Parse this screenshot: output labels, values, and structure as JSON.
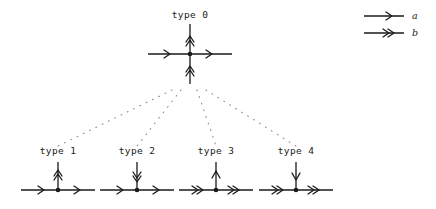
{
  "figure": {
    "background_color": "#ffffff",
    "stroke_color": "#1a1a1a",
    "dot_color": "#9a9a9a",
    "width": 436,
    "height": 209
  },
  "legend": {
    "entries": [
      {
        "id": "a",
        "label": "a",
        "arrowhead": "single",
        "icon": "single-arrow-icon"
      },
      {
        "id": "b",
        "label": "b",
        "arrowhead": "double",
        "icon": "double-arrow-icon"
      }
    ]
  },
  "nodes": [
    {
      "id": "type0",
      "label": "type 0",
      "cx": 190,
      "cy": 54,
      "horizontal": {
        "arrowhead": "single",
        "direction": "right",
        "half_length": 42
      },
      "vertical": {
        "arrowhead": "double",
        "direction": "up",
        "up_length": 30,
        "down_length": 30
      },
      "has_lower_stem": true
    },
    {
      "id": "type1",
      "label": "type 1",
      "cx": 58,
      "cy": 190,
      "horizontal": {
        "arrowhead": "single",
        "direction": "right",
        "half_length": 37
      },
      "vertical": {
        "arrowhead": "double",
        "direction": "up",
        "up_length": 28,
        "down_length": 0
      },
      "has_lower_stem": false
    },
    {
      "id": "type2",
      "label": "type 2",
      "cx": 137,
      "cy": 190,
      "horizontal": {
        "arrowhead": "single",
        "direction": "right",
        "half_length": 37
      },
      "vertical": {
        "arrowhead": "double",
        "direction": "down",
        "up_length": 28,
        "down_length": 0
      },
      "has_lower_stem": false
    },
    {
      "id": "type3",
      "label": "type 3",
      "cx": 216,
      "cy": 190,
      "horizontal": {
        "arrowhead": "double",
        "direction": "right",
        "half_length": 37
      },
      "vertical": {
        "arrowhead": "single",
        "direction": "up",
        "up_length": 28,
        "down_length": 0
      },
      "has_lower_stem": false
    },
    {
      "id": "type4",
      "label": "type 4",
      "cx": 296,
      "cy": 190,
      "horizontal": {
        "arrowhead": "double",
        "direction": "right",
        "half_length": 37
      },
      "vertical": {
        "arrowhead": "single",
        "direction": "down",
        "up_length": 28,
        "down_length": 0
      },
      "has_lower_stem": false
    }
  ],
  "connectors": [
    {
      "from": "type0",
      "to": "type1",
      "style": "dotted",
      "x1": 172,
      "y1": 90,
      "x2": 58,
      "y2": 146
    },
    {
      "from": "type0",
      "to": "type2",
      "style": "dotted",
      "x1": 181,
      "y1": 90,
      "x2": 137,
      "y2": 146
    },
    {
      "from": "type0",
      "to": "type3",
      "style": "dotted",
      "x1": 197,
      "y1": 90,
      "x2": 216,
      "y2": 146
    },
    {
      "from": "type0",
      "to": "type4",
      "style": "dotted",
      "x1": 206,
      "y1": 90,
      "x2": 296,
      "y2": 146
    }
  ],
  "labels": {
    "type0": "type 0",
    "type1": "type 1",
    "type2": "type 2",
    "type3": "type 3",
    "type4": "type 4",
    "legend_a": "a",
    "legend_b": "b"
  }
}
